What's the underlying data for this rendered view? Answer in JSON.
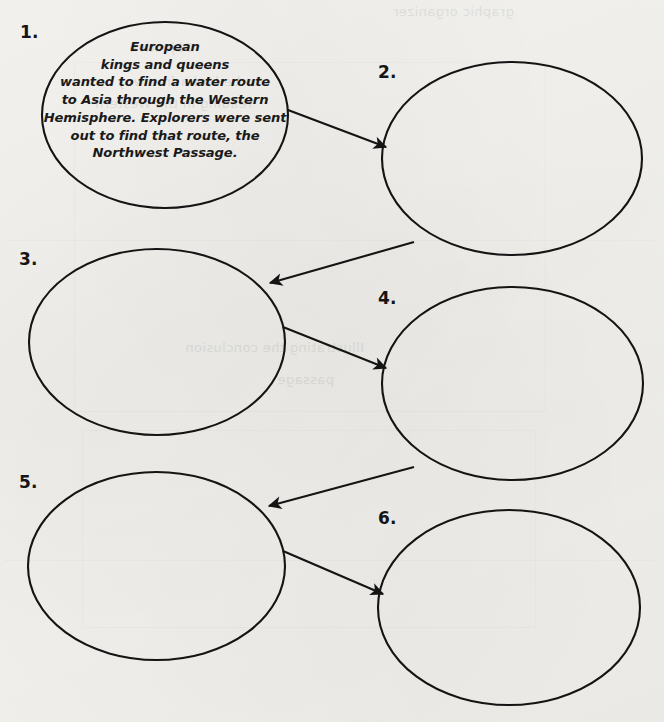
{
  "worksheet": {
    "title": "Sequence chain graphic organizer",
    "background_color": "#f3f2ef",
    "ink_color": "#1a1a1a",
    "oval_count": 6,
    "filled_oval_count": 1
  },
  "ovals": [
    {
      "number_label": "1.",
      "filled": true,
      "text_lines": [
        "European",
        "kings and queens",
        "wanted to find a water route",
        "to Asia through the Western",
        "Hemisphere. Explorers were sent",
        "out to find that route, the",
        "Northwest Passage."
      ],
      "text_plain": "European kings and queens wanted to find a water route to Asia through the Western Hemisphere. Explorers were sent out to find that route, the Northwest Passage."
    },
    {
      "number_label": "2.",
      "filled": false,
      "text_lines": [],
      "text_plain": ""
    },
    {
      "number_label": "3.",
      "filled": false,
      "text_lines": [],
      "text_plain": ""
    },
    {
      "number_label": "4.",
      "filled": false,
      "text_lines": [],
      "text_plain": ""
    },
    {
      "number_label": "5.",
      "filled": false,
      "text_lines": [],
      "text_plain": ""
    },
    {
      "number_label": "6.",
      "filled": false,
      "text_lines": [],
      "text_plain": ""
    }
  ],
  "arrows": [
    {
      "from": "1.",
      "to": "2.",
      "direction": "down-right"
    },
    {
      "from": "2.",
      "to": "3.",
      "direction": "down-left"
    },
    {
      "from": "3.",
      "to": "4.",
      "direction": "down-right"
    },
    {
      "from": "4.",
      "to": "5.",
      "direction": "down-left"
    },
    {
      "from": "5.",
      "to": "6.",
      "direction": "down-right"
    }
  ],
  "bleed_through": {
    "note": "faint mirrored show-through of printing on the reverse of the sheet; illegible",
    "lines": [
      "graphic organizer",
      "Objective",
      "to be had a free way",
      "reading in the Western",
      "Illustrating the conclusion",
      "passage"
    ]
  }
}
